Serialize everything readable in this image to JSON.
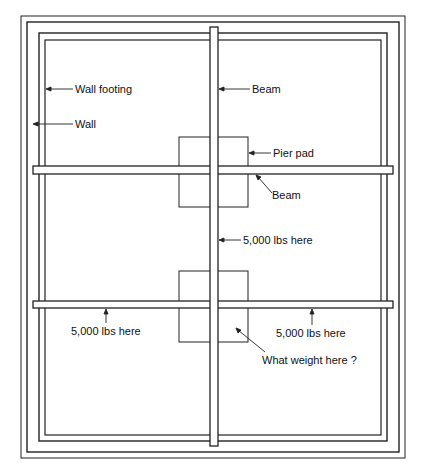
{
  "diagram": {
    "labels": {
      "wall_footing": "Wall footing",
      "wall": "Wall",
      "beam_vertical": "Beam",
      "pier_pad": "Pier pad",
      "beam_horizontal": "Beam",
      "load_center_beam": "5,000 lbs here",
      "load_left": "5,000 lbs here",
      "load_right": "5,000 lbs here",
      "question": "What weight here ?"
    },
    "colors": {
      "line": "#222222",
      "background": "#ffffff"
    }
  }
}
